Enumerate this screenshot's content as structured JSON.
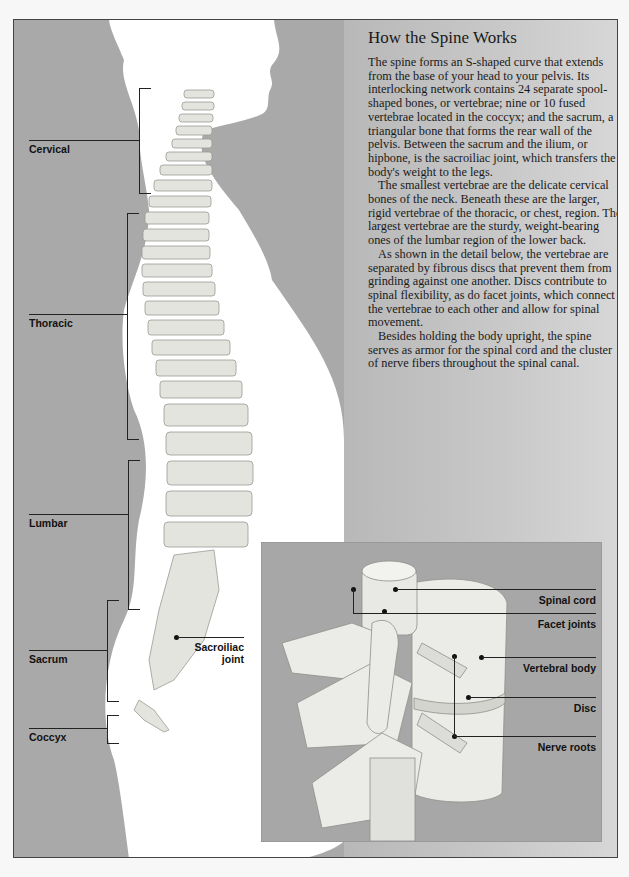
{
  "article": {
    "title": "How the Spine Works",
    "paragraphs": [
      "The spine forms an S-shaped curve that extends from the base of your head to your pelvis. Its interlocking network contains 24 separate spool-shaped bones, or vertebrae; nine or 10 fused vertebrae located in the coccyx; and the sacrum, a triangular bone that forms the rear wall of the pelvis. Between the sacrum and the ilium, or hipbone, is the sacroiliac joint, which transfers the body's weight to the legs.",
      "The smallest vertebrae are the delicate cervical bones of the neck. Beneath these are the larger, rigid vertebrae of the thoracic, or chest, region. The largest vertebrae are the sturdy, weight-bearing ones of the lumbar region of the lower back.",
      "As shown in the detail below, the vertebrae are separated by fibrous discs that prevent them from grinding against one another. Discs contribute to spinal flexibility, as do facet joints, which connect the vertebrae to each other and allow for spinal movement.",
      "Besides holding the body upright, the spine serves as armor for the spinal cord and the cluster of nerve fibers throughout the spinal canal."
    ]
  },
  "spine_regions": [
    {
      "label": "Cervical"
    },
    {
      "label": "Thoracic"
    },
    {
      "label": "Lumbar"
    },
    {
      "label": "Sacrum"
    },
    {
      "label": "Coccyx"
    }
  ],
  "sacroiliac_label": {
    "line1": "Sacroiliac",
    "line2": "joint"
  },
  "detail_labels": [
    {
      "label": "Spinal cord"
    },
    {
      "label": "Facet joints"
    },
    {
      "label": "Vertebral body"
    },
    {
      "label": "Disc"
    },
    {
      "label": "Nerve roots"
    }
  ],
  "colors": {
    "background": "#a9a9a9",
    "silhouette": "#ffffff",
    "bone": "#e6e6e2",
    "text": "#1a1a1a"
  }
}
